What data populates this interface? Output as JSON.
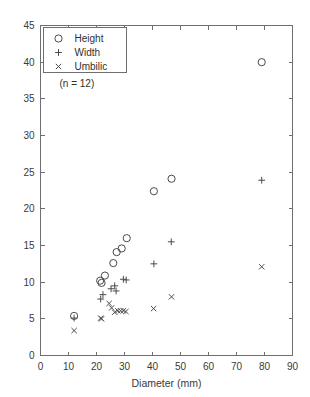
{
  "chart_data": {
    "type": "scatter",
    "title": "",
    "xlabel": "Diameter (mm)",
    "ylabel": "",
    "xlim": [
      0,
      90
    ],
    "ylim": [
      0,
      45
    ],
    "xticks": [
      0,
      10,
      20,
      30,
      40,
      50,
      60,
      70,
      80,
      90
    ],
    "yticks": [
      0,
      5,
      10,
      15,
      20,
      25,
      30,
      35,
      40,
      45
    ],
    "xtick_labels": [
      "0",
      "10",
      "20",
      "30",
      "40",
      "50",
      "60",
      "70",
      "80",
      "90"
    ],
    "ytick_labels": [
      "0",
      "5",
      "10",
      "15",
      "20",
      "25",
      "30",
      "35",
      "40",
      "45"
    ],
    "grid": false,
    "legend_position": "top-left",
    "annotation": "(n = 12)",
    "series": [
      {
        "name": "Height",
        "marker": "circle",
        "points": [
          [
            12.0,
            5.4
          ],
          [
            21.3,
            10.2
          ],
          [
            21.8,
            9.9
          ],
          [
            23.0,
            10.9
          ],
          [
            26.0,
            12.6
          ],
          [
            27.2,
            14.1
          ],
          [
            29.0,
            14.6
          ],
          [
            30.8,
            16.0
          ],
          [
            40.5,
            22.4
          ],
          [
            46.8,
            24.1
          ],
          [
            79.0,
            40.0
          ]
        ]
      },
      {
        "name": "Width",
        "marker": "plus",
        "points": [
          [
            12.0,
            5.1
          ],
          [
            21.5,
            7.7
          ],
          [
            22.3,
            8.3
          ],
          [
            25.2,
            9.1
          ],
          [
            26.5,
            9.5
          ],
          [
            27.0,
            8.8
          ],
          [
            29.6,
            10.4
          ],
          [
            30.6,
            10.3
          ],
          [
            40.5,
            12.5
          ],
          [
            46.7,
            15.5
          ],
          [
            79.0,
            23.9
          ]
        ]
      },
      {
        "name": "Umbilic",
        "marker": "cross",
        "points": [
          [
            12.0,
            3.4
          ],
          [
            21.5,
            5.1
          ],
          [
            21.8,
            5.0
          ],
          [
            24.5,
            7.1
          ],
          [
            25.4,
            6.5
          ],
          [
            26.5,
            5.9
          ],
          [
            27.6,
            6.1
          ],
          [
            28.6,
            6.1
          ],
          [
            29.6,
            6.1
          ],
          [
            30.5,
            6.0
          ],
          [
            40.4,
            6.4
          ],
          [
            46.8,
            8.0
          ],
          [
            79.0,
            12.1
          ]
        ]
      }
    ]
  },
  "legend": {
    "entries": [
      {
        "label": "Height",
        "marker": "circle"
      },
      {
        "label": "Width",
        "marker": "plus"
      },
      {
        "label": "Umbilic",
        "marker": "cross"
      }
    ]
  },
  "axes": {
    "x_title": "Diameter (mm)"
  }
}
